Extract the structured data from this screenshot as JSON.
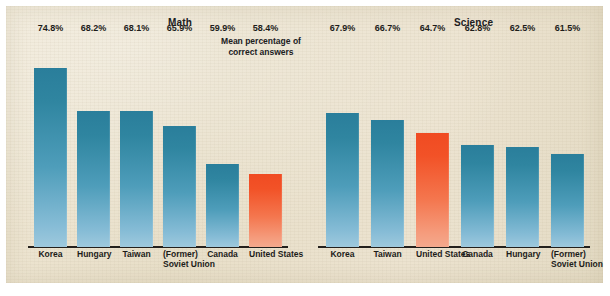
{
  "figure": {
    "annotation": {
      "line1": "Mean percentage of",
      "line2": "correct answers"
    },
    "colors": {
      "panel_background": "#eae1cb",
      "bar_blue_top": "#2a7e9b",
      "bar_blue_bottom": "#9ec9dd",
      "bar_orange_top": "#f04b22",
      "bar_orange_bottom": "#f4a98d",
      "axis_line": "#23201c",
      "text": "#1d1c1a"
    }
  },
  "chart_data": [
    {
      "type": "bar",
      "title": "Math",
      "xlabel": "",
      "ylabel": "",
      "ylim": [
        47,
        80
      ],
      "grid": false,
      "legend": null,
      "value_suffix": "%",
      "categories": [
        "Korea",
        "Hungary",
        "Taiwan",
        "(Former) Soviet Union",
        "Canada",
        "United States"
      ],
      "category_lines": [
        [
          "Korea",
          ""
        ],
        [
          "Hungary",
          ""
        ],
        [
          "Taiwan",
          ""
        ],
        [
          "(Former)",
          "Soviet Union"
        ],
        [
          "Canada",
          ""
        ],
        [
          "United States",
          ""
        ]
      ],
      "values": [
        74.8,
        68.2,
        68.1,
        65.9,
        59.9,
        58.4
      ],
      "value_labels": [
        "74.8%",
        "68.2%",
        "68.1%",
        "65.9%",
        "59.9%",
        "58.4%"
      ],
      "highlight_index": 5
    },
    {
      "type": "bar",
      "title": "Science",
      "xlabel": "",
      "ylabel": "",
      "ylim": [
        47,
        80
      ],
      "grid": false,
      "legend": null,
      "value_suffix": "%",
      "categories": [
        "Korea",
        "Taiwan",
        "United States",
        "Canada",
        "Hungary",
        "(Former) Soviet Union"
      ],
      "category_lines": [
        [
          "Korea",
          ""
        ],
        [
          "Taiwan",
          ""
        ],
        [
          "United States",
          ""
        ],
        [
          "Canada",
          ""
        ],
        [
          "Hungary",
          ""
        ],
        [
          "(Former)",
          "Soviet Union"
        ]
      ],
      "values": [
        67.9,
        66.7,
        64.7,
        62.8,
        62.5,
        61.5
      ],
      "value_labels": [
        "67.9%",
        "66.7%",
        "64.7%",
        "62.8%",
        "62.5%",
        "61.5%"
      ],
      "highlight_index": 2
    }
  ]
}
